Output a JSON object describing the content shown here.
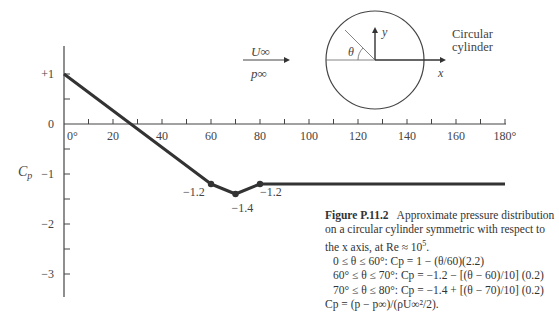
{
  "chart_data": {
    "type": "line",
    "xlabel": "θ (degrees)",
    "ylabel": "Cp",
    "xlim": [
      0,
      180
    ],
    "ylim": [
      -3.5,
      1.5
    ],
    "x_ticks": [
      0,
      20,
      40,
      60,
      80,
      100,
      120,
      140,
      160,
      180
    ],
    "x_tick_labels": [
      "0°",
      "20",
      "40",
      "60",
      "80",
      "100",
      "120",
      "140",
      "160",
      "180°"
    ],
    "y_ticks": [
      1,
      0,
      -1,
      -2,
      -3
    ],
    "y_tick_labels": [
      "+1",
      "0",
      "−1",
      "−2",
      "−3"
    ],
    "grid": false,
    "series": [
      {
        "name": "Cp",
        "x": [
          0,
          60,
          70,
          80,
          180
        ],
        "y": [
          1.0,
          -1.2,
          -1.4,
          -1.2,
          -1.2
        ]
      }
    ],
    "annotations": [
      {
        "x": 60,
        "y": -1.2,
        "text": "−1.2"
      },
      {
        "x": 70,
        "y": -1.4,
        "text": "−1.4"
      },
      {
        "x": 80,
        "y": -1.2,
        "text": "−1.2"
      }
    ]
  },
  "diagram": {
    "flow_velocity": "U∞",
    "flow_pressure": "p∞",
    "angle_label": "θ",
    "x_axis_label": "x",
    "y_axis_label": "y",
    "cylinder_label_line1": "Circular",
    "cylinder_label_line2": "cylinder"
  },
  "axis": {
    "y_title": "C",
    "y_title_sub": "p"
  },
  "caption": {
    "figure_label": "Figure P.11.2",
    "text": "Approximate pressure distribution on a circular cylinder symmetric with respect to the x axis, at Re ≈ 10",
    "re_exponent": "5",
    "text_end": ".",
    "equations": [
      "0 ≤ θ ≤ 60°: Cp = 1 − (θ/60)(2.2)",
      "60° ≤ θ ≤ 70°: Cp = −1.2 − [(θ − 60)/10] (0.2)",
      "70° ≤ θ ≤ 80°: Cp = −1.4 + [(θ − 70)/10] (0.2)",
      "Cp = (p − p∞)/(ρU∞²/2)."
    ]
  }
}
